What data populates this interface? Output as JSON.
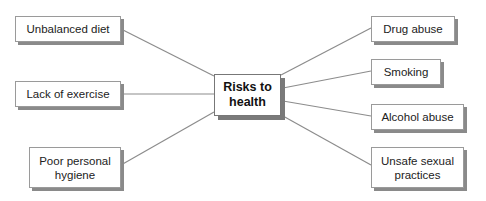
{
  "diagram": {
    "type": "mind-map",
    "center": {
      "label": "Risks to\nhealth"
    },
    "left_nodes": [
      {
        "label": "Unbalanced diet"
      },
      {
        "label": "Lack of exercise"
      },
      {
        "label": "Poor personal\nhygiene"
      }
    ],
    "right_nodes": [
      {
        "label": "Drug abuse"
      },
      {
        "label": "Smoking"
      },
      {
        "label": "Alcohol abuse"
      },
      {
        "label": "Unsafe sexual\npractices"
      }
    ],
    "colors": {
      "line": "#8c8c8c",
      "box_border": "#9a9a9a",
      "shadow": "#8a8a8a",
      "text": "#222222"
    }
  }
}
